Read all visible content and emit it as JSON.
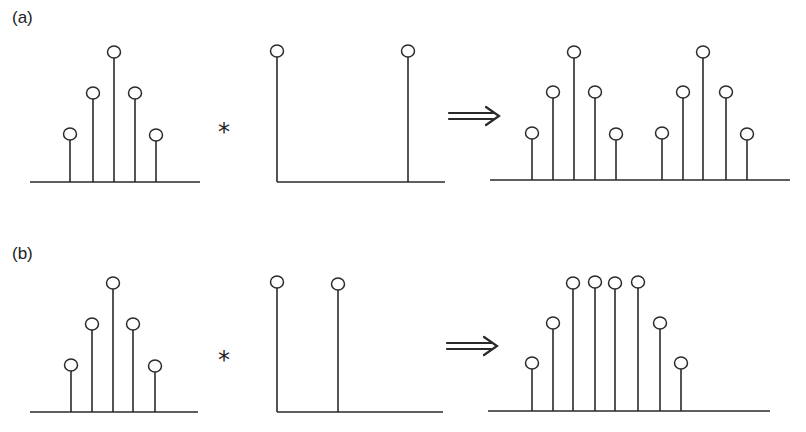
{
  "diagram": {
    "operator_symbol": "*",
    "implies_symbol": "⇒",
    "stroke_color": "#2a2a2a",
    "panels": [
      {
        "label": "(a)",
        "label_pos": [
          12,
          8
        ],
        "sequence": {
          "axis": [
            30,
            200,
            182
          ],
          "stems": [
            [
              70,
              134
            ],
            [
              93,
              93
            ],
            [
              114,
              52
            ],
            [
              135,
              93
            ],
            [
              156,
              135
            ]
          ]
        },
        "operator_pos": [
          218,
          118
        ],
        "impulses": {
          "axis": [
            277,
            445,
            182
          ],
          "left_edge": true,
          "stems": [
            [
              277,
              51
            ],
            [
              408,
              51
            ]
          ]
        },
        "arrow_pos": [
          449,
          116
        ],
        "result": {
          "axis": [
            490,
            790,
            180
          ],
          "stems": [
            [
              532,
              133
            ],
            [
              553,
              92
            ],
            [
              574,
              52
            ],
            [
              595,
              92
            ],
            [
              616,
              134
            ],
            [
              662,
              133
            ],
            [
              683,
              92
            ],
            [
              703,
              52
            ],
            [
              726,
              92
            ],
            [
              747,
              134
            ]
          ]
        }
      },
      {
        "label": "(b)",
        "label_pos": [
          12,
          244
        ],
        "sequence": {
          "axis": [
            30,
            198,
            412
          ],
          "stems": [
            [
              71,
              365
            ],
            [
              92,
              324
            ],
            [
              113,
              283
            ],
            [
              133,
              324
            ],
            [
              155,
              366
            ]
          ]
        },
        "operator_pos": [
          218,
          346
        ],
        "impulses": {
          "axis": [
            277,
            443,
            412
          ],
          "left_edge": true,
          "stems": [
            [
              277,
              282
            ],
            [
              338,
              284
            ]
          ]
        },
        "arrow_pos": [
          447,
          346
        ],
        "result": {
          "axis": [
            488,
            770,
            411
          ],
          "stems": [
            [
              532,
              363
            ],
            [
              553,
              323
            ],
            [
              573,
              283
            ],
            [
              595,
              282
            ],
            [
              615,
              283
            ],
            [
              638,
              282
            ],
            [
              660,
              323
            ],
            [
              681,
              363
            ]
          ]
        }
      }
    ]
  }
}
